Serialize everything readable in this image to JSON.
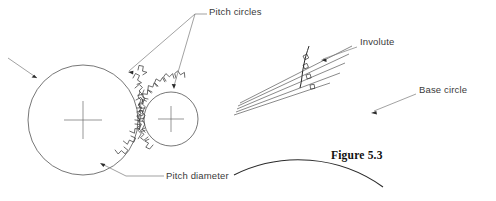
{
  "figure": {
    "caption": "Figure 5.3",
    "caption_pos": {
      "x": 331,
      "y": 149
    },
    "background_color": "#ffffff",
    "line_color": "#4a4a4a",
    "curve_color": "#2b2b2b",
    "text_color": "#3a3a3a",
    "caption_color": "#101010"
  },
  "labels": {
    "pitch_circles": {
      "text": "Pitch circles",
      "x": 209,
      "y": 7
    },
    "pitch_diameter": {
      "text": "Pitch diameter",
      "x": 166,
      "y": 178
    },
    "involute": {
      "text": "Involute",
      "x": 359,
      "y": 42
    },
    "base_circle": {
      "text": "Base circle",
      "x": 418,
      "y": 90
    }
  },
  "left_diagram": {
    "name": "meshing-gear-pair",
    "gear_large": {
      "name": "pitch-circle-gear",
      "center": {
        "x": 83,
        "y": 120
      },
      "radius": 55,
      "cross_half_len": 19
    },
    "gear_small": {
      "name": "pitch-circle-pinion",
      "center": {
        "x": 171,
        "y": 119
      },
      "radius": 27,
      "cross_half_len": 13
    },
    "tooth_profile_note": "involute gear teeth meshing at the pitch point between the two pitch circles",
    "leaders": [
      {
        "name": "leader-pitch-circles-to-gear",
        "from": {
          "x": 196,
          "y": 14
        },
        "to": {
          "x": 128,
          "y": 72
        }
      },
      {
        "name": "leader-pitch-circles-to-pinion",
        "from": {
          "x": 196,
          "y": 14
        },
        "to": {
          "x": 174,
          "y": 88
        }
      },
      {
        "name": "leader-pitch-circles-horizontal",
        "from": {
          "x": 196,
          "y": 14
        },
        "to": {
          "x": 206,
          "y": 14
        }
      },
      {
        "name": "leader-pitch-diameter",
        "from": {
          "x": 163,
          "y": 176
        },
        "to": {
          "x": 125,
          "y": 176
        }
      },
      {
        "name": "leader-pitch-diameter-angled",
        "from": {
          "x": 125,
          "y": 176
        },
        "to": {
          "x": 100,
          "y": 163
        }
      },
      {
        "name": "leader-unlabeled-left",
        "from": {
          "x": 8,
          "y": 58
        },
        "to": {
          "x": 38,
          "y": 79
        }
      }
    ]
  },
  "right_diagram": {
    "name": "involute-construction",
    "base_circle": {
      "name": "base-circle-arc",
      "center": {
        "x": 300,
        "y": 230
      },
      "radius": 145,
      "arc_from_deg": 202,
      "arc_to_deg": 305
    },
    "generating_point": {
      "x": 281,
      "y": 86
    },
    "tangent_lines": 5,
    "perpendicular_marks": 4,
    "involute_curve_note": "involute traced from the base circle through the perpendicular tick marks on successive tangents",
    "leaders": [
      {
        "name": "leader-involute",
        "from": {
          "x": 356,
          "y": 47
        },
        "to": {
          "x": 322,
          "y": 60
        }
      },
      {
        "name": "leader-base-circle",
        "from": {
          "x": 415,
          "y": 94
        },
        "to": {
          "x": 371,
          "y": 113
        }
      }
    ]
  }
}
